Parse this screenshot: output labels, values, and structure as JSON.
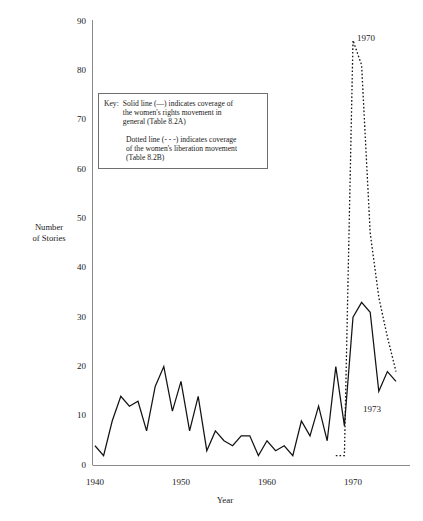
{
  "chart_data": {
    "type": "line",
    "title": "",
    "xlabel": "Year",
    "ylabel": "Number of Stories",
    "xlim": [
      1940,
      1976
    ],
    "ylim": [
      0,
      90
    ],
    "xticks": [
      1940,
      1950,
      1960,
      1970
    ],
    "yticks": [
      0,
      10,
      20,
      30,
      40,
      50,
      60,
      70,
      80,
      90
    ],
    "grid": false,
    "legend_position": "inside-upper-left",
    "series": [
      {
        "name": "Solid line (—) indicates coverage of the women's rights movement in general (Table 8.2A)",
        "style": "solid",
        "x": [
          1940,
          1941,
          1942,
          1943,
          1944,
          1945,
          1946,
          1947,
          1948,
          1949,
          1950,
          1951,
          1952,
          1953,
          1954,
          1955,
          1956,
          1957,
          1958,
          1959,
          1960,
          1961,
          1962,
          1963,
          1964,
          1965,
          1966,
          1967,
          1968,
          1969,
          1970,
          1971,
          1972,
          1973,
          1974,
          1975
        ],
        "values": [
          4,
          2,
          9,
          14,
          12,
          13,
          7,
          16,
          20,
          11,
          17,
          7,
          14,
          3,
          7,
          5,
          4,
          6,
          6,
          2,
          5,
          3,
          4,
          2,
          9,
          6,
          12,
          5,
          20,
          8,
          30,
          33,
          31,
          15,
          19,
          17
        ]
      },
      {
        "name": "Dotted line (- - -) indicates coverage of the women's liberation movement (Table 8.2B)",
        "style": "dotted",
        "x": [
          1968,
          1969,
          1970,
          1971,
          1972,
          1973,
          1974,
          1975
        ],
        "values": [
          2,
          2,
          86,
          81,
          47,
          34,
          26,
          19
        ]
      }
    ]
  },
  "key": {
    "label": "Key:",
    "line1": "Solid line (—) indicates coverage of",
    "line2": "the women's rights movement in",
    "line3": "general (Table 8.2A)",
    "line4": "Dotted line (- - -) indicates coverage",
    "line5": "of the women's liberation movement",
    "line6": "(Table 8.2B)"
  },
  "axes": {
    "y_title_line1": "Number",
    "y_title_line2": "of Stories",
    "x_title": "Year",
    "y_ticks": [
      "90",
      "80",
      "70",
      "60",
      "50",
      "40",
      "30",
      "20",
      "10",
      "0"
    ],
    "x_ticks": [
      "1940",
      "1950",
      "1960",
      "1970"
    ]
  },
  "annotations": [
    {
      "name": "peak-year-label",
      "text": "1970"
    },
    {
      "name": "solid-trough-year-label",
      "text": "1973"
    }
  ]
}
